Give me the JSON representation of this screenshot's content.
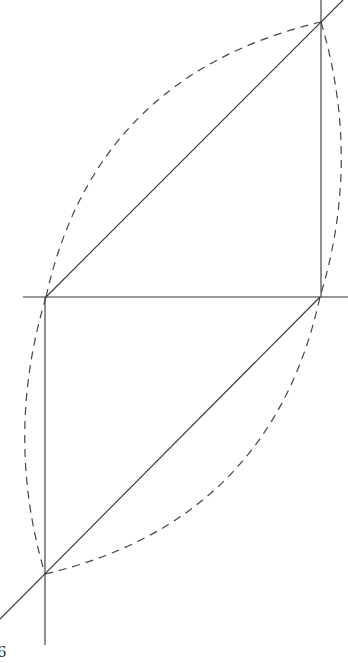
{
  "diagram": {
    "type": "geometric-construction",
    "stroke_color": "#333333",
    "dash_color": "#444444",
    "points": {
      "top_right": [
        321,
        22
      ],
      "mid_left": [
        46,
        297
      ],
      "mid_right": [
        320,
        297
      ],
      "bottom_left": [
        45,
        574
      ]
    },
    "page_label": "6"
  }
}
